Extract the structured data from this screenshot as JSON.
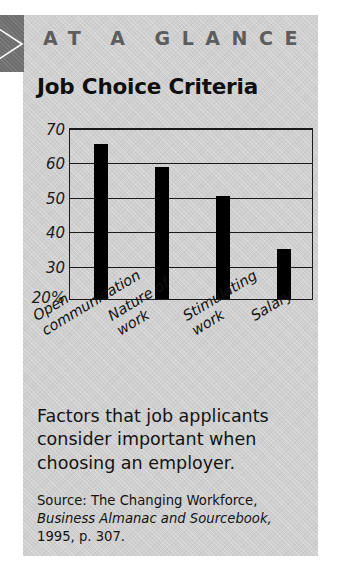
{
  "header": {
    "flag_icon": "right-arrow-icon",
    "kicker": "AT A GLANCE"
  },
  "caption": {
    "text": "Factors that job applicants consider important when choosing an employer."
  },
  "source": {
    "line1": "Source: The Changing Workforce,",
    "line2": "Business Almanac and Sourcebook,",
    "line3": "1995, p. 307."
  },
  "chart_data": {
    "type": "bar",
    "title": "Job Choice Criteria",
    "xlabel": "",
    "ylabel": "",
    "categories": [
      "Open communication",
      "Nature of work",
      "Stimulating work",
      "Salary"
    ],
    "category_lines": [
      [
        "Open",
        "communication"
      ],
      [
        "Nature of",
        "work"
      ],
      [
        "Stimulating",
        "work"
      ],
      [
        "Salary"
      ]
    ],
    "values": [
      65,
      58.5,
      50,
      34.5
    ],
    "ylim": [
      20,
      70
    ],
    "yticks": [
      70,
      60,
      50,
      40,
      30
    ],
    "ytick_labels": [
      "70",
      "60",
      "50",
      "40",
      "30"
    ],
    "y_base_label": "20%",
    "grid": true,
    "legend": "none",
    "bar_color": "#000000",
    "axis_color": "#1a1a1a",
    "panel_color": "#cfcfcf"
  }
}
